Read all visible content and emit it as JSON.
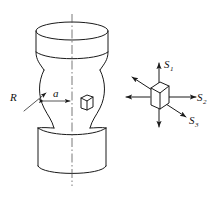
{
  "figure": {
    "background_color": "#ffffff",
    "line_color": "#1a1a1a",
    "labels": {
      "radius": {
        "symbol": "R",
        "sub": ""
      },
      "neck_half_width": {
        "symbol": "a",
        "sub": ""
      },
      "stress_axial": {
        "symbol": "S",
        "sub": "1"
      },
      "stress_transverse": {
        "symbol": "S",
        "sub": "2"
      },
      "stress_radial": {
        "symbol": "S",
        "sub": "3"
      }
    },
    "specimen": {
      "name": "round-bar-necked-specimen",
      "parts": [
        "upper-cylinder",
        "neck-contour",
        "lower-cylinder",
        "axis-centerline",
        "surface-cube-element"
      ]
    },
    "stress_element": {
      "name": "stress-cube",
      "arrows": [
        {
          "name": "arrow-up",
          "direction": "up",
          "label": "S1"
        },
        {
          "name": "arrow-down",
          "direction": "down",
          "label": ""
        },
        {
          "name": "arrow-right",
          "direction": "right",
          "label": "S2"
        },
        {
          "name": "arrow-left",
          "direction": "left",
          "label": ""
        },
        {
          "name": "arrow-lower-right",
          "direction": "lower-right",
          "label": "S3"
        },
        {
          "name": "arrow-upper-left",
          "direction": "upper-left",
          "label": ""
        }
      ]
    }
  }
}
